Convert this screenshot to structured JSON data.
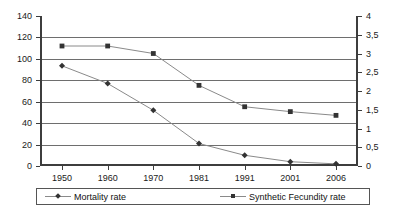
{
  "chart_data": {
    "type": "line",
    "title": "",
    "xlabel": "",
    "ylabel": "",
    "categories": [
      "1950",
      "1960",
      "1970",
      "1981",
      "1991",
      "2001",
      "2006"
    ],
    "grid": true,
    "legend_position": "bottom",
    "axes": {
      "left": {
        "label": "",
        "min": 0,
        "max": 140,
        "step": 20,
        "ticks": [
          "0",
          "20",
          "40",
          "60",
          "80",
          "100",
          "120",
          "140"
        ]
      },
      "right": {
        "label": "",
        "min": 0,
        "max": 4,
        "step": 0.5,
        "ticks": [
          "0",
          "0,5",
          "1",
          "1,5",
          "2",
          "2,5",
          "3",
          "3,5",
          "4"
        ]
      }
    },
    "series": [
      {
        "name": "Mortality rate",
        "marker": "diamond",
        "axis": "left",
        "color": "#8a8a8a",
        "marker_color": "#333333",
        "values": [
          93.5,
          77,
          52,
          21,
          10,
          4,
          2
        ]
      },
      {
        "name": "Synthetic Fecundity rate",
        "marker": "square",
        "axis": "right",
        "color": "#8a8a8a",
        "marker_color": "#333333",
        "values": [
          3.2,
          3.2,
          3.0,
          2.15,
          1.58,
          1.45,
          1.35
        ]
      }
    ]
  },
  "legend": {
    "items": [
      {
        "label": "Mortality rate"
      },
      {
        "label": "Synthetic Fecundity rate"
      }
    ]
  }
}
